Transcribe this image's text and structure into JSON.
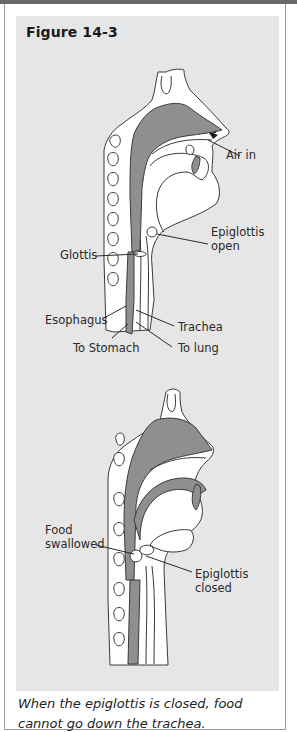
{
  "figure": {
    "title": "Figure 14-3",
    "caption": "When the epiglottis is closed, food cannot go down the trachea."
  },
  "top_diagram": {
    "state": "Epiglottis open",
    "labels": {
      "air_in": "Air in",
      "epiglottis_open_1": "Epiglottis",
      "epiglottis_open_2": "open",
      "glottis": "Glottis",
      "esophagus": "Esophagus",
      "trachea": "Trachea",
      "to_stomach": "To Stomach",
      "to_lung": "To lung"
    }
  },
  "bottom_diagram": {
    "state": "Epiglottis closed",
    "labels": {
      "food_1": "Food",
      "food_2": "swallowed",
      "epiglottis_closed_1": "Epiglottis",
      "epiglottis_closed_2": "closed"
    }
  },
  "colors": {
    "panel": "#e6e6e6",
    "tissue_dark": "#8f8f8f",
    "tissue_light": "#ffffff",
    "outline": "#3a3a3a",
    "topbar": "#6a6a6a"
  }
}
